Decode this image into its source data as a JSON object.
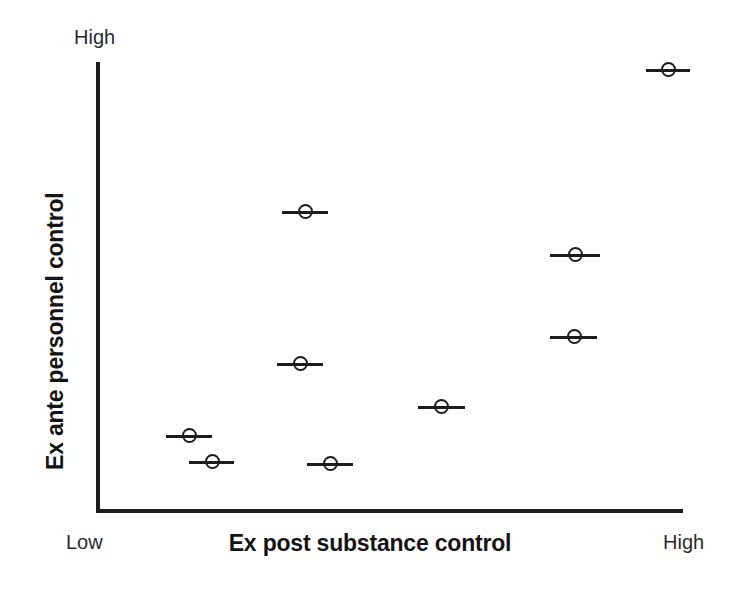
{
  "figure": {
    "background_color": "#ffffff",
    "ink_color": "#1c1c1c"
  },
  "axes": {
    "y_label": "Ex ante personnel control",
    "x_label": "Ex post substance control",
    "y_high_caption": "High",
    "x_low_caption": "Low",
    "x_high_caption": "High"
  },
  "chart_data": {
    "type": "scatter",
    "title": "",
    "xlabel": "Ex post substance control",
    "ylabel": "Ex ante personnel control",
    "xlim": [
      0,
      1
    ],
    "ylim": [
      0,
      1
    ],
    "x_tick_labels": [
      "Low",
      "High"
    ],
    "y_tick_labels": [
      "High"
    ],
    "grid": false,
    "legend": null,
    "marker_style": "open-circle-with-horizontal-bar",
    "points": [
      {
        "x": 0.154,
        "y": 0.167,
        "bar_half_width": 0.039
      },
      {
        "x": 0.193,
        "y": 0.109,
        "bar_half_width": 0.039
      },
      {
        "x": 0.396,
        "y": 0.105,
        "bar_half_width": 0.039
      },
      {
        "x": 0.344,
        "y": 0.327,
        "bar_half_width": 0.04
      },
      {
        "x": 0.353,
        "y": 0.666,
        "bar_half_width": 0.039
      },
      {
        "x": 0.586,
        "y": 0.232,
        "bar_half_width": 0.04
      },
      {
        "x": 0.813,
        "y": 0.388,
        "bar_half_width": 0.04
      },
      {
        "x": 0.815,
        "y": 0.571,
        "bar_half_width": 0.043
      },
      {
        "x": 0.974,
        "y": 0.983,
        "bar_half_width": 0.038
      }
    ]
  }
}
